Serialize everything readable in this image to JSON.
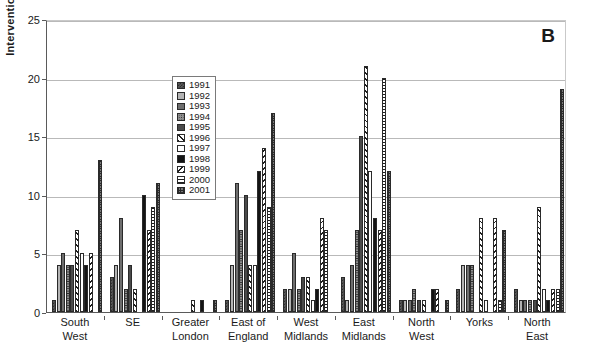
{
  "panel": {
    "letter": "B"
  },
  "axes": {
    "ylabel": "Interventions",
    "yticks": [
      "0",
      "5",
      "10",
      "15",
      "20",
      "25"
    ]
  },
  "legend": {
    "title": "",
    "entries": [
      {
        "label": "1991",
        "pattern": "p1991"
      },
      {
        "label": "1992",
        "pattern": "p1992"
      },
      {
        "label": "1993",
        "pattern": "p1993"
      },
      {
        "label": "1994",
        "pattern": "p1994"
      },
      {
        "label": "1995",
        "pattern": "p1995"
      },
      {
        "label": "1996",
        "pattern": "p1996"
      },
      {
        "label": "1997",
        "pattern": "p1997"
      },
      {
        "label": "1998",
        "pattern": "p1998"
      },
      {
        "label": "1999",
        "pattern": "p1999"
      },
      {
        "label": "2000",
        "pattern": "p2000"
      },
      {
        "label": "2001",
        "pattern": "p2001"
      }
    ]
  },
  "chart_data": {
    "type": "bar",
    "title": "",
    "xlabel": "",
    "ylabel": "Interventions",
    "ylim": [
      0,
      25
    ],
    "ytick_step": 5,
    "grid": true,
    "legend_position": "inside-upper-left",
    "categories": [
      "South\nWest",
      "SE",
      "Greater\nLondon",
      "East of\nEngland",
      "West\nMidlands",
      "East\nMidlands",
      "North\nWest",
      "Yorks",
      "North\nEast"
    ],
    "series": [
      {
        "name": "1991",
        "values": [
          1,
          3,
          0,
          1,
          2,
          3,
          1,
          2,
          2
        ]
      },
      {
        "name": "1992",
        "values": [
          4,
          4,
          0,
          4,
          2,
          1,
          1,
          4,
          1
        ]
      },
      {
        "name": "1993",
        "values": [
          5,
          8,
          0,
          11,
          5,
          4,
          1,
          4,
          1
        ]
      },
      {
        "name": "1994",
        "values": [
          4,
          2,
          0,
          7,
          2,
          7,
          2,
          4,
          1
        ]
      },
      {
        "name": "1995",
        "values": [
          4,
          4,
          0,
          10,
          3,
          15,
          1,
          0,
          1
        ]
      },
      {
        "name": "1996",
        "values": [
          7,
          2,
          1,
          4,
          3,
          21,
          1,
          8,
          9
        ]
      },
      {
        "name": "1997",
        "values": [
          5,
          0,
          0,
          4,
          1,
          12,
          0,
          1,
          2
        ]
      },
      {
        "name": "1998",
        "values": [
          4,
          10,
          1,
          12,
          2,
          8,
          2,
          0,
          1
        ]
      },
      {
        "name": "1999",
        "values": [
          5,
          7,
          0,
          14,
          8,
          7,
          2,
          8,
          2
        ]
      },
      {
        "name": "2000",
        "values": [
          0,
          9,
          0,
          9,
          7,
          20,
          0,
          1,
          2
        ]
      },
      {
        "name": "2001",
        "values": [
          13,
          11,
          1,
          17,
          0,
          12,
          1,
          7,
          19
        ]
      }
    ]
  }
}
